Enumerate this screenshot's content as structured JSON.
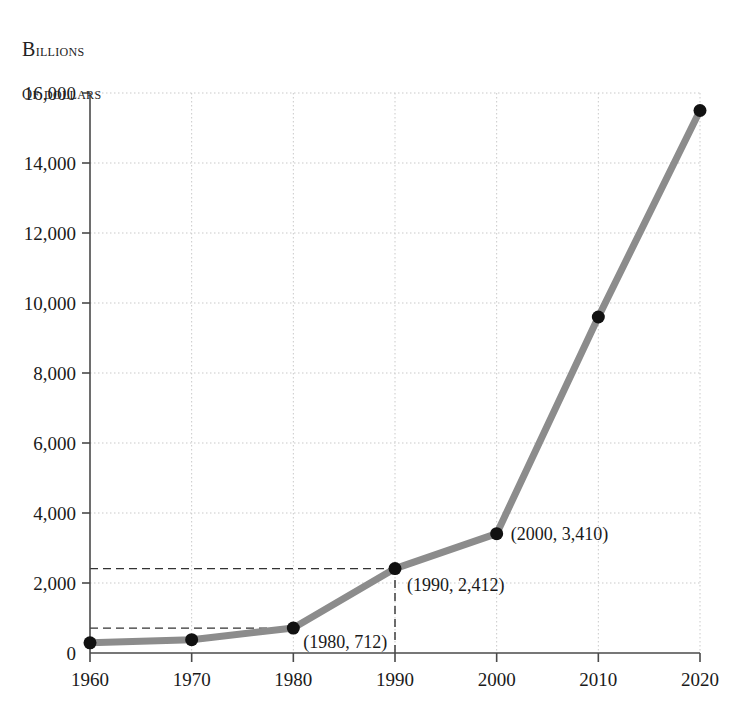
{
  "chart_data": {
    "type": "line",
    "title": "",
    "ylabel_lines": [
      "Billions",
      "of dollars"
    ],
    "xlabel": "",
    "x": [
      1960,
      1970,
      1980,
      1990,
      2000,
      2010,
      2020
    ],
    "values": [
      290,
      380,
      712,
      2412,
      3410,
      9600,
      15500
    ],
    "categories": [
      "1960",
      "1970",
      "1980",
      "1990",
      "2000",
      "2010",
      "2020"
    ],
    "xtick_labels": [
      "1960",
      "1970",
      "1980",
      "1990",
      "2000",
      "2010",
      "2020"
    ],
    "ytick_labels": [
      "0",
      "2,000",
      "4,000",
      "6,000",
      "8,000",
      "10,000",
      "12,000",
      "14,000",
      "16,000"
    ],
    "ytick_values": [
      0,
      2000,
      4000,
      6000,
      8000,
      10000,
      12000,
      14000,
      16000
    ],
    "xlim": [
      1960,
      2020
    ],
    "ylim": [
      0,
      16000
    ],
    "grid": true,
    "legend": false,
    "series_color": "#8c8c8c",
    "marker_color": "#111111",
    "grid_color": "#c9c9c9",
    "guide_color": "#333333",
    "annotations": [
      {
        "label": "(1980, 712)",
        "x": 1980,
        "y": 712
      },
      {
        "label": "(1990, 2,412)",
        "x": 1990,
        "y": 2412
      },
      {
        "label": "(2000, 3,410)",
        "x": 2000,
        "y": 3410
      }
    ],
    "guides": [
      {
        "type": "horizontal",
        "value": 712,
        "from_x": 1960,
        "to_x": 1980
      },
      {
        "type": "horizontal",
        "value": 2412,
        "from_x": 1960,
        "to_x": 1990
      },
      {
        "type": "vertical",
        "value": 1990,
        "from_y": 0,
        "to_y": 2412
      }
    ]
  }
}
